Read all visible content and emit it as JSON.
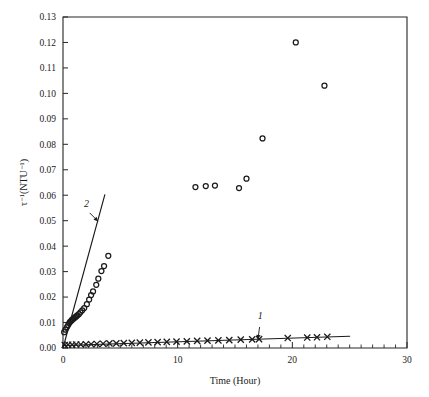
{
  "chart_data": {
    "type": "scatter",
    "title": "",
    "xlabel": "Time (Hour)",
    "ylabel": "τ⁻¹(NTU⁻¹)",
    "xlim": [
      0,
      30
    ],
    "ylim": [
      0.0,
      0.13
    ],
    "xticks": [
      0,
      10,
      20,
      30
    ],
    "xtick_labels": [
      "0",
      "10",
      "20",
      "30"
    ],
    "xtick_minor_step": 1,
    "yticks": [
      0.0,
      0.01,
      0.02,
      0.03,
      0.04,
      0.05,
      0.06,
      0.07,
      0.08,
      0.09,
      0.1,
      0.11,
      0.12,
      0.13
    ],
    "ytick_labels": [
      "0.00",
      "0.01",
      "0.02",
      "0.03",
      "0.04",
      "0.05",
      "0.06",
      "0.07",
      "0.08",
      "0.09",
      "0.10",
      "0.11",
      "0.12",
      "0.13"
    ],
    "grid": false,
    "legend_position": "inline-annotations",
    "annotations": [
      {
        "text": "1",
        "x": 17.2,
        "y": 0.0112,
        "target_x": 17.0,
        "target_y": 0.0035
      },
      {
        "text": "2",
        "x": 2.05,
        "y": 0.0555,
        "target_x": 3.05,
        "target_y": 0.0498
      }
    ],
    "series": [
      {
        "name": "1",
        "label": "1",
        "marker": "x",
        "color": "#1a1a1a",
        "points": [
          [
            0.15,
            0.0012
          ],
          [
            0.45,
            0.0013
          ],
          [
            0.8,
            0.0013
          ],
          [
            1.15,
            0.0014
          ],
          [
            1.55,
            0.0014
          ],
          [
            2.0,
            0.0015
          ],
          [
            2.45,
            0.0015
          ],
          [
            2.95,
            0.0016
          ],
          [
            3.5,
            0.0017
          ],
          [
            4.05,
            0.0018
          ],
          [
            4.65,
            0.0018
          ],
          [
            5.3,
            0.0019
          ],
          [
            6.0,
            0.002
          ],
          [
            6.7,
            0.0021
          ],
          [
            7.45,
            0.0022
          ],
          [
            8.25,
            0.0023
          ],
          [
            9.05,
            0.0024
          ],
          [
            9.9,
            0.0025
          ],
          [
            10.8,
            0.0026
          ],
          [
            11.7,
            0.0028
          ],
          [
            12.6,
            0.0029
          ],
          [
            13.55,
            0.003
          ],
          [
            14.5,
            0.0031
          ],
          [
            15.5,
            0.0033
          ],
          [
            16.5,
            0.0034
          ],
          [
            17.1,
            0.0035
          ],
          [
            19.6,
            0.0039
          ],
          [
            21.3,
            0.0041
          ],
          [
            22.15,
            0.0042
          ],
          [
            23.05,
            0.0044
          ]
        ],
        "fit_line": {
          "x0": 0.0,
          "y0": 0.001,
          "x1": 25.0,
          "y1": 0.0046
        }
      },
      {
        "name": "2",
        "label": "2",
        "marker": "o",
        "color": "#1a1a1a",
        "points": [
          [
            0.1,
            0.0062
          ],
          [
            0.22,
            0.0072
          ],
          [
            0.35,
            0.0082
          ],
          [
            0.45,
            0.009
          ],
          [
            0.55,
            0.0098
          ],
          [
            0.62,
            0.0103
          ],
          [
            0.7,
            0.0106
          ],
          [
            0.78,
            0.011
          ],
          [
            0.86,
            0.0113
          ],
          [
            0.95,
            0.0117
          ],
          [
            1.05,
            0.012
          ],
          [
            1.15,
            0.0124
          ],
          [
            1.25,
            0.0128
          ],
          [
            1.38,
            0.0133
          ],
          [
            1.52,
            0.014
          ],
          [
            1.68,
            0.0148
          ],
          [
            1.85,
            0.0157
          ],
          [
            2.08,
            0.0172
          ],
          [
            2.28,
            0.019
          ],
          [
            2.45,
            0.0208
          ],
          [
            2.62,
            0.0222
          ],
          [
            2.9,
            0.0248
          ],
          [
            3.08,
            0.0272
          ],
          [
            3.35,
            0.0302
          ],
          [
            3.58,
            0.0322
          ],
          [
            3.95,
            0.0362
          ],
          [
            11.55,
            0.0632
          ],
          [
            12.45,
            0.0636
          ],
          [
            13.25,
            0.0638
          ],
          [
            15.35,
            0.0628
          ],
          [
            16.0,
            0.0665
          ],
          [
            17.4,
            0.0823
          ],
          [
            20.3,
            0.12
          ],
          [
            22.8,
            0.103
          ]
        ],
        "fit_line": {
          "x0": 0.0,
          "y0": 0.0,
          "x1": 3.65,
          "y1": 0.0602
        }
      }
    ]
  }
}
